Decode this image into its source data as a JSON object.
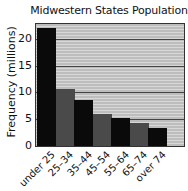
{
  "chart_data": {
    "type": "bar",
    "title": "Midwestern States Population",
    "xlabel": "",
    "ylabel": "Frequency (millions)",
    "categories": [
      "under 25",
      "25–34",
      "35–44",
      "45–54",
      "55–64",
      "65–74",
      "over 74"
    ],
    "values": [
      22,
      10.6,
      8.6,
      6.0,
      5.3,
      4.3,
      3.4
    ],
    "ylim": [
      0,
      23
    ],
    "yticks": [
      "0",
      "5",
      "10",
      "15",
      "20"
    ],
    "grid": true,
    "legend": null,
    "bar_colors": [
      "#0a0a0a",
      "#4a4a4a",
      "#0a0a0a",
      "#4a4a4a",
      "#0a0a0a",
      "#4a4a4a",
      "#0a0a0a"
    ]
  }
}
